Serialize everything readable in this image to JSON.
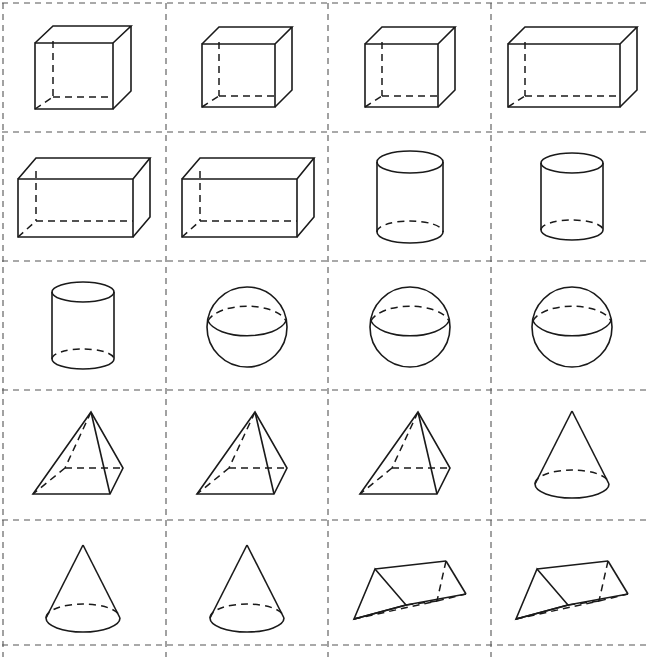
{
  "worksheet": {
    "title": "Geometric Solids Grid Worksheet",
    "columns": 4,
    "rows": 5,
    "cell_count": 20,
    "background_color": "#ffffff",
    "line_color": "#1a1a1a",
    "grid_line_style": "dashed",
    "grid_line_color": "#555555"
  },
  "legend": {
    "solid_edge_label": "visible edge (solid)",
    "hidden_edge_label": "hidden edge (dashed)"
  },
  "cells": [
    {
      "index": 1,
      "row": 1,
      "col": 1,
      "shape": "cube",
      "label": "Cube",
      "icon": "cube-icon"
    },
    {
      "index": 2,
      "row": 1,
      "col": 2,
      "shape": "cube",
      "label": "Cube",
      "icon": "cube-icon"
    },
    {
      "index": 3,
      "row": 1,
      "col": 3,
      "shape": "cube",
      "label": "Cube",
      "icon": "cube-icon"
    },
    {
      "index": 4,
      "row": 1,
      "col": 4,
      "shape": "rectangular-prism",
      "label": "Rectangular prism",
      "icon": "rectangular-prism-icon"
    },
    {
      "index": 5,
      "row": 2,
      "col": 1,
      "shape": "rectangular-prism",
      "label": "Rectangular prism",
      "icon": "rectangular-prism-icon"
    },
    {
      "index": 6,
      "row": 2,
      "col": 2,
      "shape": "rectangular-prism",
      "label": "Rectangular prism",
      "icon": "rectangular-prism-icon"
    },
    {
      "index": 7,
      "row": 2,
      "col": 3,
      "shape": "cylinder",
      "label": "Cylinder",
      "icon": "cylinder-icon"
    },
    {
      "index": 8,
      "row": 2,
      "col": 4,
      "shape": "cylinder",
      "label": "Cylinder",
      "icon": "cylinder-icon"
    },
    {
      "index": 9,
      "row": 3,
      "col": 1,
      "shape": "cylinder",
      "label": "Cylinder",
      "icon": "cylinder-icon"
    },
    {
      "index": 10,
      "row": 3,
      "col": 2,
      "shape": "sphere",
      "label": "Sphere",
      "icon": "sphere-icon"
    },
    {
      "index": 11,
      "row": 3,
      "col": 3,
      "shape": "sphere",
      "label": "Sphere",
      "icon": "sphere-icon"
    },
    {
      "index": 12,
      "row": 3,
      "col": 4,
      "shape": "sphere",
      "label": "Sphere",
      "icon": "sphere-icon"
    },
    {
      "index": 13,
      "row": 4,
      "col": 1,
      "shape": "square-pyramid",
      "label": "Square pyramid",
      "icon": "square-pyramid-icon"
    },
    {
      "index": 14,
      "row": 4,
      "col": 2,
      "shape": "square-pyramid",
      "label": "Square pyramid",
      "icon": "square-pyramid-icon"
    },
    {
      "index": 15,
      "row": 4,
      "col": 3,
      "shape": "square-pyramid",
      "label": "Square pyramid",
      "icon": "square-pyramid-icon"
    },
    {
      "index": 16,
      "row": 4,
      "col": 4,
      "shape": "cone",
      "label": "Cone",
      "icon": "cone-icon"
    },
    {
      "index": 17,
      "row": 5,
      "col": 1,
      "shape": "cone",
      "label": "Cone",
      "icon": "cone-icon"
    },
    {
      "index": 18,
      "row": 5,
      "col": 2,
      "shape": "cone",
      "label": "Cone",
      "icon": "cone-icon"
    },
    {
      "index": 19,
      "row": 5,
      "col": 3,
      "shape": "triangular-prism",
      "label": "Triangular prism",
      "icon": "triangular-prism-icon"
    },
    {
      "index": 20,
      "row": 5,
      "col": 4,
      "shape": "triangular-prism",
      "label": "Triangular prism",
      "icon": "triangular-prism-icon"
    }
  ]
}
